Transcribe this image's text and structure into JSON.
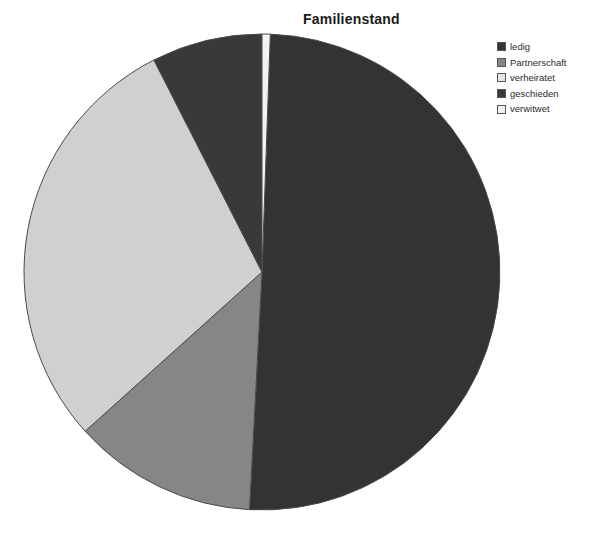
{
  "chart_data": {
    "type": "pie",
    "title": "Familienstand",
    "xlabel": "",
    "ylabel": "",
    "legend_position": "top-right",
    "grid": false,
    "start_angle_deg": 0,
    "direction": "clockwise",
    "categories": [
      "ledig",
      "Partnerschaft",
      "verheiratet",
      "geschieden",
      "verwitwet"
    ],
    "values": [
      50.3,
      12.5,
      29.2,
      7.5,
      0.5
    ],
    "units": "percent",
    "slices": [
      {
        "label": "ledig",
        "value": 50.3,
        "start_angle_deg": 2,
        "end_angle_deg": 183,
        "sweep_deg": 181,
        "color": "#333333"
      },
      {
        "label": "Partnerschaft",
        "value": 12.5,
        "start_angle_deg": 183,
        "end_angle_deg": 228,
        "sweep_deg": 45,
        "color": "#868686"
      },
      {
        "label": "verheiratet",
        "value": 29.2,
        "start_angle_deg": 228,
        "end_angle_deg": 333,
        "sweep_deg": 105,
        "color": "#d0d0d0"
      },
      {
        "label": "geschieden",
        "value": 7.5,
        "start_angle_deg": 333,
        "end_angle_deg": 360,
        "sweep_deg": 27,
        "color": "#393939"
      },
      {
        "label": "verwitwet",
        "value": 0.5,
        "start_angle_deg": 0,
        "end_angle_deg": 2,
        "sweep_deg": 2,
        "color": "#f2f2f2"
      }
    ],
    "geometry": {
      "center_x": 262,
      "center_y": 272,
      "radius": 238,
      "outline_color": "#4a4a4a"
    }
  },
  "legend": {
    "items": [
      {
        "label": "ledig",
        "color": "#333333"
      },
      {
        "label": "Partnerschaft",
        "color": "#868686"
      },
      {
        "label": "verheiratet",
        "color": "#e6e6e6"
      },
      {
        "label": "geschieden",
        "color": "#393939"
      },
      {
        "label": "verwitwet",
        "color": "#f2f2f2"
      }
    ]
  }
}
